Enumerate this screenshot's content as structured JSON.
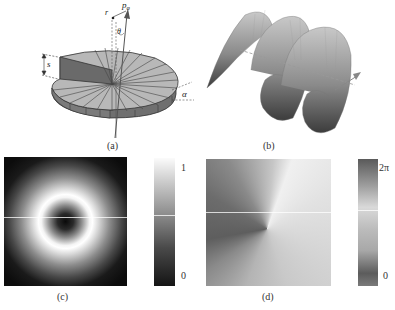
{
  "figure": {
    "panels": [
      {
        "id": "a",
        "label": "(a)",
        "description": "Spiral phase plate with step height s, divided into wedge segments; incident ray with momentum p_phi, radius r, angle theta, tilt alpha",
        "annotations": {
          "step_height": "s",
          "radius": "r",
          "momentum": "p",
          "momentum_subscript": "φ",
          "angle": "θ",
          "tilt": "α"
        }
      },
      {
        "id": "b",
        "label": "(b)",
        "description": "Helical wavefront surface with propagation arrow"
      },
      {
        "id": "c",
        "label": "(c)",
        "description": "Doughnut-shaped intensity profile",
        "colorbar": {
          "max_label": "1",
          "min_label": "0"
        }
      },
      {
        "id": "d",
        "label": "(d)",
        "description": "Azimuthal phase profile",
        "colorbar": {
          "max_label": "2π",
          "min_label": "0"
        }
      }
    ]
  },
  "colors": {
    "plate_top": "#b8b8b8",
    "plate_side": "#6f6f6f",
    "plate_edge": "#3a3a3a",
    "helix_light": "#c8c8c8",
    "helix_dark": "#3c3c3c",
    "arrow": "#8a8a8a"
  }
}
